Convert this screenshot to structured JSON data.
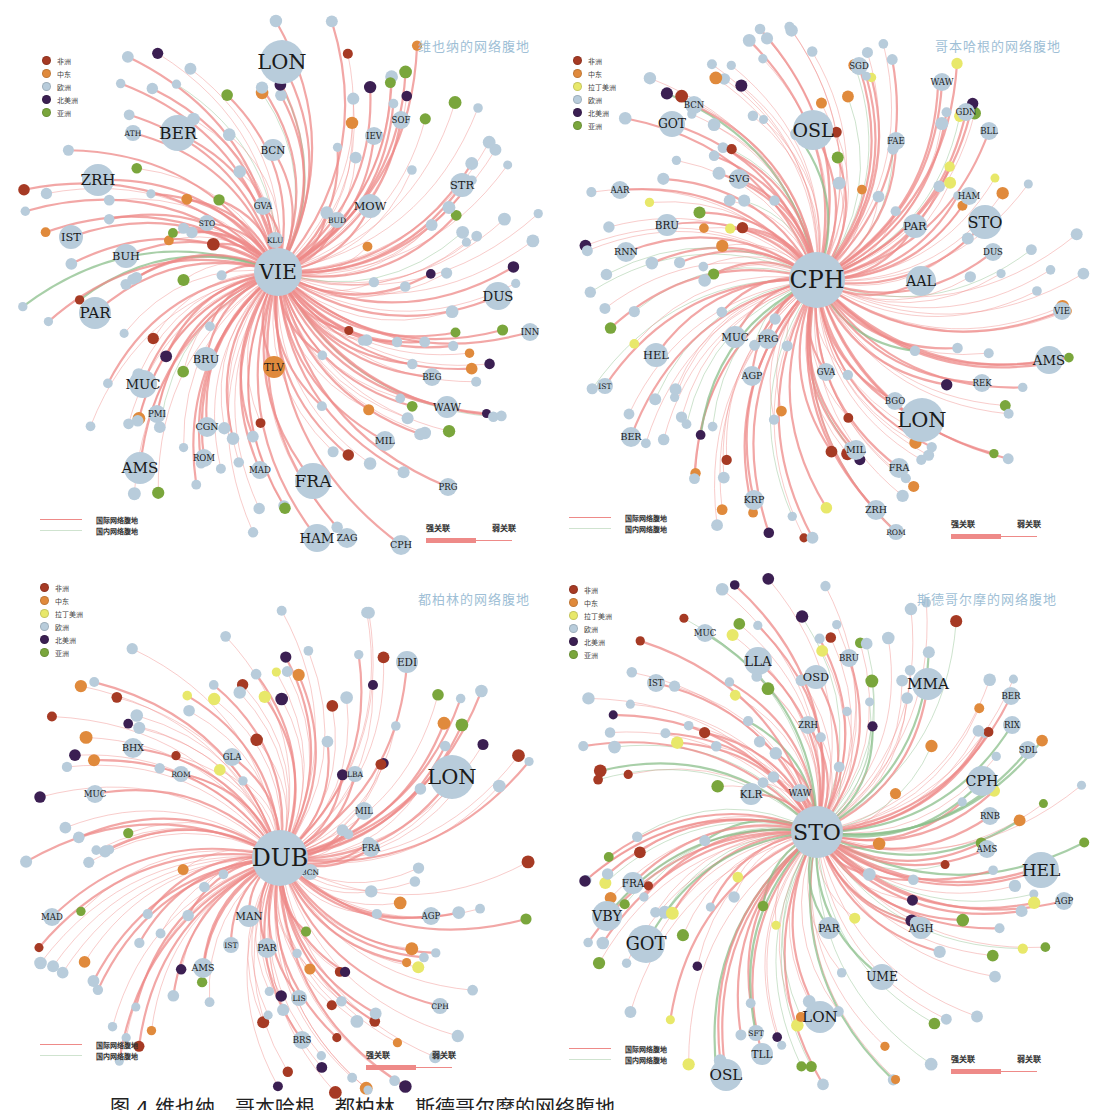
{
  "colors": {
    "africa": "#a63a24",
    "middle_east": "#e08a3c",
    "latin_america": "#e8e86a",
    "europe": "#b8ccdb",
    "north_america": "#3b1f52",
    "asia": "#7aa63c",
    "international_link": "#ee8a88",
    "domestic_link": "#8bbf8b",
    "title": "#9fbfd6"
  },
  "legend_regions": {
    "africa": "非洲",
    "middle_east": "中东",
    "latin_america": "拉丁美洲",
    "europe": "欧洲",
    "north_america": "北美洲",
    "asia": "亚洲"
  },
  "line_legend": {
    "international": "国际网络腹地",
    "domestic": "国内网络腹地"
  },
  "strength_legend": {
    "strong": "强关联",
    "weak": "弱关联"
  },
  "caption": "图 4  维也纳、哥本哈根、都柏林、斯德哥尔摩的网络腹地",
  "panels": [
    {
      "title": "维也纳的网络腹地",
      "hub": "VIE",
      "legend": [
        "africa",
        "middle_east",
        "europe",
        "north_america",
        "asia"
      ],
      "big_nodes": [
        {
          "label": "LON",
          "x": 282,
          "y": 62,
          "r": 22,
          "region": "europe"
        },
        {
          "label": "BER",
          "x": 178,
          "y": 133,
          "r": 18,
          "region": "europe"
        },
        {
          "label": "ZRH",
          "x": 98,
          "y": 180,
          "r": 16,
          "region": "europe"
        },
        {
          "label": "PAR",
          "x": 95,
          "y": 313,
          "r": 16,
          "region": "europe"
        },
        {
          "label": "FRA",
          "x": 313,
          "y": 481,
          "r": 18,
          "region": "europe"
        },
        {
          "label": "AMS",
          "x": 140,
          "y": 468,
          "r": 16,
          "region": "europe"
        },
        {
          "label": "HAM",
          "x": 317,
          "y": 538,
          "r": 14,
          "region": "europe"
        },
        {
          "label": "DUS",
          "x": 498,
          "y": 296,
          "r": 14,
          "region": "europe"
        },
        {
          "label": "MUC",
          "x": 143,
          "y": 384,
          "r": 14,
          "region": "europe"
        },
        {
          "label": "BRU",
          "x": 206,
          "y": 359,
          "r": 12,
          "region": "europe"
        },
        {
          "label": "MOW",
          "x": 370,
          "y": 206,
          "r": 12,
          "region": "europe"
        },
        {
          "label": "STR",
          "x": 462,
          "y": 185,
          "r": 12,
          "region": "europe"
        },
        {
          "label": "IST",
          "x": 71,
          "y": 237,
          "r": 12,
          "region": "europe"
        },
        {
          "label": "BUH",
          "x": 126,
          "y": 256,
          "r": 12,
          "region": "europe"
        },
        {
          "label": "BCN",
          "x": 273,
          "y": 150,
          "r": 11,
          "region": "europe"
        },
        {
          "label": "TLV",
          "x": 274,
          "y": 367,
          "r": 11,
          "region": "middle_east"
        },
        {
          "label": "MIL",
          "x": 385,
          "y": 441,
          "r": 10,
          "region": "europe"
        },
        {
          "label": "WAW",
          "x": 447,
          "y": 407,
          "r": 11,
          "region": "europe"
        },
        {
          "label": "CGN",
          "x": 207,
          "y": 427,
          "r": 10,
          "region": "europe"
        },
        {
          "label": "CPH",
          "x": 401,
          "y": 545,
          "r": 10,
          "region": "europe"
        },
        {
          "label": "ZAG",
          "x": 347,
          "y": 538,
          "r": 10,
          "region": "europe"
        },
        {
          "label": "IEV",
          "x": 374,
          "y": 136,
          "r": 9,
          "region": "europe"
        },
        {
          "label": "SOF",
          "x": 401,
          "y": 120,
          "r": 9,
          "region": "europe"
        },
        {
          "label": "PRG",
          "x": 448,
          "y": 487,
          "r": 9,
          "region": "europe"
        },
        {
          "label": "BEG",
          "x": 432,
          "y": 377,
          "r": 9,
          "region": "europe"
        },
        {
          "label": "ROM",
          "x": 204,
          "y": 458,
          "r": 9,
          "region": "europe"
        },
        {
          "label": "MAD",
          "x": 260,
          "y": 470,
          "r": 9,
          "region": "europe"
        },
        {
          "label": "PMI",
          "x": 157,
          "y": 414,
          "r": 9,
          "region": "europe"
        },
        {
          "label": "GVA",
          "x": 263,
          "y": 206,
          "r": 9,
          "region": "europe"
        },
        {
          "label": "STO",
          "x": 207,
          "y": 223,
          "r": 8,
          "region": "europe"
        },
        {
          "label": "BUD",
          "x": 337,
          "y": 220,
          "r": 8,
          "region": "europe"
        },
        {
          "label": "KLU",
          "x": 275,
          "y": 240,
          "r": 8,
          "region": "europe"
        },
        {
          "label": "INN",
          "x": 530,
          "y": 332,
          "r": 9,
          "region": "europe"
        },
        {
          "label": "ATH",
          "x": 133,
          "y": 133,
          "r": 8,
          "region": "europe"
        }
      ]
    },
    {
      "title": "哥本哈根的网络腹地",
      "hub": "CPH",
      "legend": [
        "africa",
        "middle_east",
        "latin_america",
        "europe",
        "north_america",
        "asia"
      ],
      "big_nodes": [
        {
          "label": "OSL",
          "x": 813,
          "y": 130,
          "r": 20,
          "region": "europe"
        },
        {
          "label": "LON",
          "x": 922,
          "y": 420,
          "r": 22,
          "region": "europe"
        },
        {
          "label": "STO",
          "x": 985,
          "y": 222,
          "r": 17,
          "region": "europe"
        },
        {
          "label": "AAL",
          "x": 921,
          "y": 281,
          "r": 15,
          "region": "europe"
        },
        {
          "label": "AMS",
          "x": 1049,
          "y": 360,
          "r": 14,
          "region": "europe"
        },
        {
          "label": "GOT",
          "x": 672,
          "y": 124,
          "r": 13,
          "region": "europe"
        },
        {
          "label": "HEL",
          "x": 656,
          "y": 355,
          "r": 12,
          "region": "europe"
        },
        {
          "label": "PAR",
          "x": 915,
          "y": 226,
          "r": 12,
          "region": "europe"
        },
        {
          "label": "MUC",
          "x": 735,
          "y": 337,
          "r": 11,
          "region": "europe"
        },
        {
          "label": "BRU",
          "x": 667,
          "y": 225,
          "r": 11,
          "region": "europe"
        },
        {
          "label": "RNN",
          "x": 626,
          "y": 252,
          "r": 10,
          "region": "europe"
        },
        {
          "label": "PRG",
          "x": 768,
          "y": 339,
          "r": 10,
          "region": "europe"
        },
        {
          "label": "AGP",
          "x": 752,
          "y": 376,
          "r": 10,
          "region": "europe"
        },
        {
          "label": "SVG",
          "x": 739,
          "y": 179,
          "r": 10,
          "region": "europe"
        },
        {
          "label": "BCN",
          "x": 694,
          "y": 105,
          "r": 9,
          "region": "europe"
        },
        {
          "label": "FAE",
          "x": 896,
          "y": 141,
          "r": 9,
          "region": "europe"
        },
        {
          "label": "GDN",
          "x": 966,
          "y": 112,
          "r": 9,
          "region": "europe"
        },
        {
          "label": "BLL",
          "x": 989,
          "y": 131,
          "r": 9,
          "region": "europe"
        },
        {
          "label": "HAM",
          "x": 969,
          "y": 196,
          "r": 9,
          "region": "europe"
        },
        {
          "label": "DUS",
          "x": 993,
          "y": 252,
          "r": 9,
          "region": "europe"
        },
        {
          "label": "VIE",
          "x": 1062,
          "y": 311,
          "r": 9,
          "region": "europe"
        },
        {
          "label": "REK",
          "x": 982,
          "y": 383,
          "r": 9,
          "region": "europe"
        },
        {
          "label": "BGO",
          "x": 895,
          "y": 401,
          "r": 9,
          "region": "europe"
        },
        {
          "label": "MIL",
          "x": 856,
          "y": 450,
          "r": 10,
          "region": "europe"
        },
        {
          "label": "FRA",
          "x": 899,
          "y": 468,
          "r": 10,
          "region": "europe"
        },
        {
          "label": "ZRH",
          "x": 876,
          "y": 510,
          "r": 10,
          "region": "europe"
        },
        {
          "label": "KRP",
          "x": 754,
          "y": 500,
          "r": 10,
          "region": "europe"
        },
        {
          "label": "BER",
          "x": 631,
          "y": 437,
          "r": 10,
          "region": "europe"
        },
        {
          "label": "IST",
          "x": 605,
          "y": 386,
          "r": 8,
          "region": "europe"
        },
        {
          "label": "AAR",
          "x": 620,
          "y": 190,
          "r": 9,
          "region": "europe"
        },
        {
          "label": "SGD",
          "x": 859,
          "y": 66,
          "r": 9,
          "region": "europe"
        },
        {
          "label": "WAW",
          "x": 942,
          "y": 82,
          "r": 9,
          "region": "europe"
        },
        {
          "label": "ROM",
          "x": 896,
          "y": 532,
          "r": 8,
          "region": "europe"
        },
        {
          "label": "GVA",
          "x": 826,
          "y": 372,
          "r": 9,
          "region": "europe"
        }
      ]
    },
    {
      "title": "都柏林的网络腹地",
      "hub": "DUB",
      "legend": [
        "africa",
        "middle_east",
        "latin_america",
        "europe",
        "north_america",
        "asia"
      ],
      "big_nodes": [
        {
          "label": "LON",
          "x": 452,
          "y": 777,
          "r": 22,
          "region": "europe"
        },
        {
          "label": "EDI",
          "x": 407,
          "y": 662,
          "r": 11,
          "region": "europe"
        },
        {
          "label": "BHX",
          "x": 133,
          "y": 748,
          "r": 10,
          "region": "europe"
        },
        {
          "label": "MAN",
          "x": 249,
          "y": 916,
          "r": 11,
          "region": "europe"
        },
        {
          "label": "PAR",
          "x": 267,
          "y": 948,
          "r": 10,
          "region": "europe"
        },
        {
          "label": "AMS",
          "x": 203,
          "y": 968,
          "r": 10,
          "region": "europe"
        },
        {
          "label": "FRA",
          "x": 371,
          "y": 848,
          "r": 9,
          "region": "europe"
        },
        {
          "label": "AGP",
          "x": 431,
          "y": 916,
          "r": 9,
          "region": "europe"
        },
        {
          "label": "MIL",
          "x": 364,
          "y": 811,
          "r": 9,
          "region": "europe"
        },
        {
          "label": "GLA",
          "x": 232,
          "y": 757,
          "r": 9,
          "region": "europe"
        },
        {
          "label": "MUC",
          "x": 95,
          "y": 794,
          "r": 9,
          "region": "europe"
        },
        {
          "label": "MAD",
          "x": 52,
          "y": 917,
          "r": 9,
          "region": "europe"
        },
        {
          "label": "BRS",
          "x": 302,
          "y": 1040,
          "r": 9,
          "region": "europe"
        },
        {
          "label": "LIS",
          "x": 299,
          "y": 998,
          "r": 8,
          "region": "europe"
        },
        {
          "label": "ROM",
          "x": 181,
          "y": 774,
          "r": 8,
          "region": "europe"
        },
        {
          "label": "LBA",
          "x": 355,
          "y": 774,
          "r": 8,
          "region": "europe"
        },
        {
          "label": "CPH",
          "x": 440,
          "y": 1006,
          "r": 8,
          "region": "europe"
        },
        {
          "label": "IST",
          "x": 231,
          "y": 945,
          "r": 8,
          "region": "europe"
        },
        {
          "label": "BCN",
          "x": 310,
          "y": 872,
          "r": 8,
          "region": "europe"
        }
      ]
    },
    {
      "title": "斯德哥尔摩的网络腹地",
      "hub": "STO",
      "legend": [
        "africa",
        "middle_east",
        "latin_america",
        "europe",
        "north_america",
        "asia"
      ],
      "big_nodes": [
        {
          "label": "MMA",
          "x": 928,
          "y": 684,
          "r": 16,
          "region": "europe"
        },
        {
          "label": "LLA",
          "x": 758,
          "y": 661,
          "r": 14,
          "region": "europe"
        },
        {
          "label": "OSD",
          "x": 816,
          "y": 677,
          "r": 12,
          "region": "europe"
        },
        {
          "label": "HEL",
          "x": 1041,
          "y": 870,
          "r": 18,
          "region": "europe"
        },
        {
          "label": "CPH",
          "x": 982,
          "y": 781,
          "r": 15,
          "region": "europe"
        },
        {
          "label": "GOT",
          "x": 646,
          "y": 944,
          "r": 19,
          "region": "europe"
        },
        {
          "label": "LON",
          "x": 820,
          "y": 1017,
          "r": 16,
          "region": "europe"
        },
        {
          "label": "OSL",
          "x": 726,
          "y": 1075,
          "r": 16,
          "region": "europe"
        },
        {
          "label": "VBY",
          "x": 607,
          "y": 916,
          "r": 15,
          "region": "europe"
        },
        {
          "label": "UME",
          "x": 882,
          "y": 977,
          "r": 13,
          "region": "europe"
        },
        {
          "label": "PAR",
          "x": 829,
          "y": 928,
          "r": 11,
          "region": "europe"
        },
        {
          "label": "AGH",
          "x": 921,
          "y": 928,
          "r": 11,
          "region": "europe"
        },
        {
          "label": "KLR",
          "x": 751,
          "y": 794,
          "r": 11,
          "region": "europe"
        },
        {
          "label": "FRA",
          "x": 633,
          "y": 883,
          "r": 11,
          "region": "europe"
        },
        {
          "label": "TLL",
          "x": 762,
          "y": 1054,
          "r": 11,
          "region": "europe"
        },
        {
          "label": "AMS",
          "x": 987,
          "y": 849,
          "r": 9,
          "region": "europe"
        },
        {
          "label": "RNB",
          "x": 990,
          "y": 816,
          "r": 9,
          "region": "europe"
        },
        {
          "label": "SDL",
          "x": 1028,
          "y": 750,
          "r": 9,
          "region": "europe"
        },
        {
          "label": "RIX",
          "x": 1012,
          "y": 725,
          "r": 9,
          "region": "europe"
        },
        {
          "label": "BER",
          "x": 1011,
          "y": 696,
          "r": 9,
          "region": "europe"
        },
        {
          "label": "AGP",
          "x": 1064,
          "y": 901,
          "r": 9,
          "region": "europe"
        },
        {
          "label": "BRU",
          "x": 849,
          "y": 658,
          "r": 9,
          "region": "europe"
        },
        {
          "label": "ZRH",
          "x": 808,
          "y": 725,
          "r": 9,
          "region": "europe"
        },
        {
          "label": "MUC",
          "x": 705,
          "y": 633,
          "r": 9,
          "region": "europe"
        },
        {
          "label": "IST",
          "x": 656,
          "y": 683,
          "r": 9,
          "region": "europe"
        },
        {
          "label": "WAW",
          "x": 800,
          "y": 793,
          "r": 9,
          "region": "europe"
        },
        {
          "label": "SFT",
          "x": 756,
          "y": 1033,
          "r": 8,
          "region": "europe"
        }
      ]
    }
  ]
}
